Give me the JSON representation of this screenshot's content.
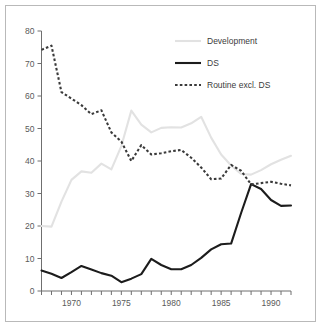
{
  "figure": {
    "background_color": "#ffffff",
    "frame_color": "#b9b9b9",
    "axis_color": "#6f6f6f"
  },
  "legend": {
    "position": "top-right",
    "entries": [
      {
        "label": "Development",
        "color": "#e2e2e2",
        "style": "solid"
      },
      {
        "label": "DS",
        "color": "#1c1c1c",
        "style": "solid"
      },
      {
        "label": "Routine excl. DS",
        "color": "#3a3a3a",
        "style": "dashed"
      }
    ]
  },
  "axes": {
    "y_ticks": [
      "0",
      "10",
      "20",
      "30",
      "40",
      "50",
      "60",
      "70",
      "80"
    ],
    "x_ticks_labeled": [
      "1970",
      "1975",
      "1980",
      "1985",
      "1990"
    ]
  },
  "chart_data": {
    "type": "line",
    "title": "",
    "subtitle": "",
    "xlabel": "",
    "ylabel": "",
    "xlim": [
      1967,
      1992
    ],
    "ylim": [
      0,
      80
    ],
    "grid": false,
    "legend_position": "top-right",
    "x": [
      1967,
      1968,
      1969,
      1970,
      1971,
      1972,
      1973,
      1974,
      1975,
      1976,
      1977,
      1978,
      1979,
      1980,
      1981,
      1982,
      1983,
      1984,
      1985,
      1986,
      1987,
      1988,
      1989,
      1990,
      1991,
      1992
    ],
    "xtick_labels": [
      "",
      "",
      "",
      "1970",
      "",
      "",
      "",
      "",
      "1975",
      "",
      "",
      "",
      "",
      "1980",
      "",
      "",
      "",
      "",
      "1985",
      "",
      "",
      "",
      "",
      "1990",
      "",
      ""
    ],
    "ytick_labels": [
      "0",
      "10",
      "20",
      "30",
      "40",
      "50",
      "60",
      "70",
      "80"
    ],
    "ytick_values": [
      0,
      10,
      20,
      30,
      40,
      50,
      60,
      70,
      80
    ],
    "series": [
      {
        "name": "Development",
        "color": "#e2e2e2",
        "style": "solid",
        "values": [
          20.0,
          19.8,
          27.5,
          34.2,
          36.8,
          36.4,
          39.2,
          37.4,
          44.6,
          55.5,
          51.2,
          48.8,
          50.2,
          50.4,
          50.3,
          51.6,
          53.6,
          47.2,
          42.0,
          38.6,
          36.0,
          35.8,
          37.2,
          39.0,
          40.4,
          41.6
        ]
      },
      {
        "name": "DS",
        "color": "#1c1c1c",
        "style": "solid",
        "values": [
          6.3,
          5.3,
          4.0,
          5.8,
          7.7,
          6.6,
          5.5,
          4.7,
          2.7,
          3.8,
          5.2,
          9.9,
          8.0,
          6.7,
          6.7,
          8.0,
          10.2,
          12.8,
          14.4,
          14.6,
          24.0,
          32.9,
          31.4,
          28.0,
          26.2,
          26.3
        ]
      },
      {
        "name": "Routine excl. DS",
        "color": "#3a3a3a",
        "style": "dashed",
        "values": [
          74.2,
          75.5,
          61.2,
          59.2,
          57.2,
          54.4,
          55.6,
          48.8,
          46.0,
          40.0,
          44.9,
          42.0,
          42.4,
          43.0,
          43.4,
          41.0,
          38.0,
          34.4,
          34.6,
          38.8,
          37.0,
          32.8,
          33.2,
          33.6,
          33.0,
          32.5
        ]
      }
    ]
  }
}
